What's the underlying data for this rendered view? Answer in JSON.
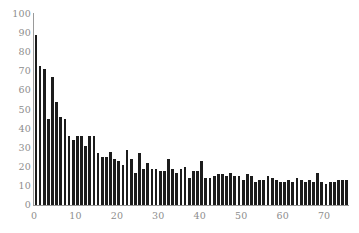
{
  "chart_data": {
    "type": "bar",
    "title": "",
    "subtitle": "",
    "xlabel": "",
    "ylabel": "",
    "xlim": [
      0,
      76
    ],
    "ylim": [
      0,
      100
    ],
    "grid": false,
    "legend": null,
    "bar_color": "#1c1c1c",
    "axis_color": "#9a9a9a",
    "tick_label_color": "#8d8d8d",
    "background_color": "#ffffff",
    "y_ticks": [
      0,
      10,
      20,
      30,
      40,
      50,
      60,
      70,
      80,
      90,
      100
    ],
    "y_tick_labels": [
      "0",
      "10",
      "20",
      "30",
      "40",
      "50",
      "60",
      "70",
      "80",
      "90",
      "100"
    ],
    "x_ticks": [
      0,
      10,
      20,
      30,
      40,
      50,
      60,
      70
    ],
    "x_tick_labels": [
      "0",
      "10",
      "20",
      "30",
      "40",
      "50",
      "60",
      "70"
    ],
    "categories": [
      0,
      1,
      2,
      3,
      4,
      5,
      6,
      7,
      8,
      9,
      10,
      11,
      12,
      13,
      14,
      15,
      16,
      17,
      18,
      19,
      20,
      21,
      22,
      23,
      24,
      25,
      26,
      27,
      28,
      29,
      30,
      31,
      32,
      33,
      34,
      35,
      36,
      37,
      38,
      39,
      40,
      41,
      42,
      43,
      44,
      45,
      46,
      47,
      48,
      49,
      50,
      51,
      52,
      53,
      54,
      55,
      56,
      57,
      58,
      59,
      60,
      61,
      62,
      63,
      64,
      65,
      66,
      67,
      68,
      69,
      70,
      71,
      72,
      73,
      74,
      75
    ],
    "values": [
      89,
      73,
      71,
      45,
      67,
      54,
      46,
      45,
      36,
      34,
      36,
      36,
      31,
      36,
      36,
      27,
      25,
      25,
      28,
      24,
      23,
      21,
      29,
      24,
      17,
      27,
      19,
      22,
      19,
      19,
      18,
      18,
      24,
      19,
      17,
      19,
      20,
      14,
      18,
      18,
      23,
      14,
      14,
      15,
      16,
      16,
      15,
      17,
      15,
      15,
      13,
      16,
      15,
      12,
      13,
      13,
      15,
      14,
      13,
      12,
      12,
      13,
      12,
      14,
      13,
      12,
      13,
      12,
      17,
      12,
      11,
      12,
      12,
      13,
      13,
      13
    ]
  }
}
